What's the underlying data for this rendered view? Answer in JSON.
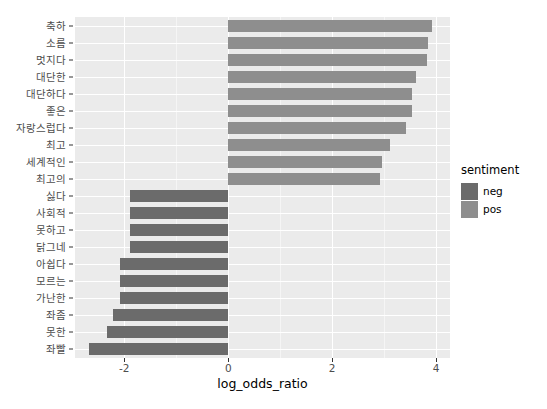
{
  "chart_data": {
    "type": "bar",
    "orientation": "horizontal",
    "title": "",
    "xlabel": "log_odds_ratio",
    "ylabel": "",
    "xlim": [
      -2.95,
      4.27
    ],
    "xticks": [
      -2,
      0,
      2,
      4
    ],
    "xtick_labels": [
      "-2",
      "0",
      "2",
      "4"
    ],
    "grid": true,
    "grid_minor_x": [
      -3,
      -1,
      1,
      3
    ],
    "legend": {
      "title": "sentiment",
      "position": "right",
      "entries": [
        {
          "label": "neg",
          "color": "#6b6b6b"
        },
        {
          "label": "pos",
          "color": "#8e8e8e"
        }
      ]
    },
    "categories": [
      "축하",
      "소름",
      "멋지다",
      "대단한",
      "대단하다",
      "좋은",
      "자랑스럽다",
      "최고",
      "세계적인",
      "최고의",
      "싫다",
      "사회적",
      "못하고",
      "닭그네",
      "아쉽다",
      "모르는",
      "가난한",
      "좌좀",
      "못한",
      "좌빨"
    ],
    "values": [
      3.92,
      3.85,
      3.83,
      3.62,
      3.54,
      3.54,
      3.42,
      3.12,
      2.96,
      2.92,
      -1.9,
      -1.9,
      -1.9,
      -1.9,
      -2.08,
      -2.08,
      -2.08,
      -2.21,
      -2.33,
      -2.69
    ],
    "groups": [
      "pos",
      "pos",
      "pos",
      "pos",
      "pos",
      "pos",
      "pos",
      "pos",
      "pos",
      "pos",
      "neg",
      "neg",
      "neg",
      "neg",
      "neg",
      "neg",
      "neg",
      "neg",
      "neg",
      "neg"
    ]
  },
  "colors": {
    "panel_background": "#ebebeb",
    "grid_major": "#ffffff",
    "grid_minor": "#f5f5f5",
    "neg": "#6b6b6b",
    "pos": "#8e8e8e",
    "axis_text": "#4d4d4d",
    "title_text": "#000000"
  }
}
